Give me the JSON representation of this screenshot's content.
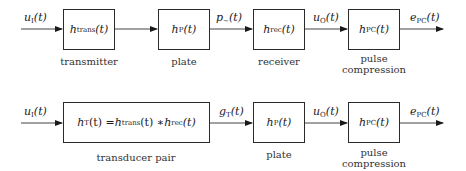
{
  "row1": {
    "input_signal": {
      "sym": "u",
      "sub": "I",
      "arg": "(t)"
    },
    "blocks": [
      {
        "sym": "h",
        "sub": "trans",
        "arg": "(t)",
        "caption": "transmitter"
      },
      {
        "sym": "h",
        "sub": "P",
        "arg": "(t)",
        "caption": "plate"
      },
      {
        "sym": "h",
        "sub": "rec",
        "arg": "(t)",
        "caption": "receiver"
      },
      {
        "sym": "h",
        "sub": "PC",
        "arg": "(t)",
        "caption_line1": "pulse",
        "caption_line2": "compression"
      }
    ],
    "signals": [
      {
        "sym": "p",
        "sub": "∼",
        "arg": "(t)"
      },
      {
        "sym": "u",
        "sub": "O",
        "arg": "(t)"
      },
      {
        "sym": "e",
        "sub": "PC",
        "arg": "(t)"
      }
    ]
  },
  "row2": {
    "input_signal": {
      "sym": "u",
      "sub": "I",
      "arg": "(t)"
    },
    "blocks": [
      {
        "lhs_sym": "h",
        "lhs_sub": "T",
        "lhs_arg": "(t) = ",
        "a_sym": "h",
        "a_sub": "trans",
        "a_arg": "(t) ∗ ",
        "b_sym": "h",
        "b_sub": "rec",
        "b_arg": "(t)",
        "caption": "transducer pair"
      },
      {
        "sym": "h",
        "sub": "P",
        "arg": "(t)",
        "caption": "plate"
      },
      {
        "sym": "h",
        "sub": "PC",
        "arg": "(t)",
        "caption_line1": "pulse",
        "caption_line2": "compression"
      }
    ],
    "signals": [
      {
        "sym": "g",
        "sub": "T",
        "arg": "(t)"
      },
      {
        "sym": "u",
        "sub": "O",
        "arg": "(t)"
      },
      {
        "sym": "e",
        "sub": "PC",
        "arg": "(t)"
      }
    ]
  }
}
